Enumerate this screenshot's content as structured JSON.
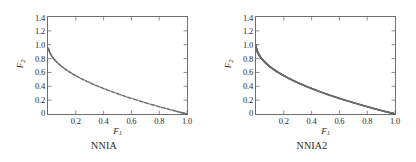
{
  "figure": {
    "background": "#ffffff",
    "curve_color": "#6b6b6b",
    "axis_color": "#6e6e6e"
  },
  "panels": [
    {
      "caption": "NNIA",
      "chart_data": {
        "type": "scatter",
        "title": "NNIA",
        "xlabel": "F1",
        "ylabel": "F2",
        "xlim": [
          0,
          1.0
        ],
        "ylim": [
          0,
          1.4
        ],
        "xticks": [
          "0.2",
          "0.4",
          "0.6",
          "0.8",
          "1.0"
        ],
        "xtick_values": [
          0.2,
          0.4,
          0.6,
          0.8,
          1.0
        ],
        "yticks": [
          "0",
          "0.2",
          "0.4",
          "0.6",
          "0.8",
          "1.0",
          "1.2",
          "1.4"
        ],
        "ytick_values": [
          0,
          0.2,
          0.4,
          0.6,
          0.8,
          1.0,
          1.2,
          1.4
        ],
        "grid": false,
        "legend": "none",
        "marker": "dot",
        "series": [
          {
            "name": "Pareto front (NNIA)",
            "relation": "F2 = 1 - sqrt(F1)",
            "x": [
              0.002,
              0.006,
              0.012,
              0.02,
              0.03,
              0.042,
              0.056,
              0.072,
              0.09,
              0.11,
              0.13,
              0.155,
              0.18,
              0.205,
              0.232,
              0.26,
              0.29,
              0.32,
              0.35,
              0.382,
              0.415,
              0.448,
              0.482,
              0.516,
              0.55,
              0.585,
              0.62,
              0.655,
              0.69,
              0.725,
              0.76,
              0.795,
              0.83,
              0.862,
              0.893,
              0.92,
              0.944,
              0.964,
              0.98,
              0.992,
              1.0
            ],
            "y": [
              0.955,
              0.923,
              0.89,
              0.859,
              0.827,
              0.795,
              0.763,
              0.732,
              0.7,
              0.668,
              0.639,
              0.606,
              0.576,
              0.547,
              0.518,
              0.49,
              0.461,
              0.434,
              0.408,
              0.382,
              0.356,
              0.331,
              0.306,
              0.282,
              0.258,
              0.235,
              0.213,
              0.191,
              0.169,
              0.149,
              0.128,
              0.108,
              0.089,
              0.072,
              0.055,
              0.041,
              0.028,
              0.018,
              0.01,
              0.004,
              0.0
            ]
          }
        ]
      }
    },
    {
      "caption": "NNIA2",
      "chart_data": {
        "type": "line",
        "title": "NNIA2",
        "xlabel": "F1",
        "ylabel": "F2",
        "xlim": [
          0,
          1.0
        ],
        "ylim": [
          0,
          1.4
        ],
        "xticks": [
          "0.2",
          "0.4",
          "0.6",
          "0.8",
          "1.0"
        ],
        "xtick_values": [
          0.2,
          0.4,
          0.6,
          0.8,
          1.0
        ],
        "yticks": [
          "0",
          "0.2",
          "0.4",
          "0.6",
          "0.8",
          "1.0",
          "1.2",
          "1.4"
        ],
        "ytick_values": [
          0,
          0.2,
          0.4,
          0.6,
          0.8,
          1.0,
          1.2,
          1.4
        ],
        "grid": false,
        "legend": "none",
        "marker": "dense-dot",
        "series": [
          {
            "name": "Pareto front (NNIA2)",
            "relation": "F2 = 1 - sqrt(F1)",
            "x": [
              0.0,
              0.002,
              0.005,
              0.01,
              0.016,
              0.024,
              0.034,
              0.046,
              0.06,
              0.075,
              0.092,
              0.11,
              0.13,
              0.152,
              0.175,
              0.2,
              0.226,
              0.253,
              0.281,
              0.31,
              0.34,
              0.371,
              0.403,
              0.436,
              0.47,
              0.505,
              0.54,
              0.576,
              0.612,
              0.649,
              0.686,
              0.723,
              0.76,
              0.797,
              0.833,
              0.868,
              0.901,
              0.932,
              0.959,
              0.981,
              0.995,
              1.0
            ],
            "y": [
              1.0,
              0.955,
              0.929,
              0.9,
              0.874,
              0.845,
              0.816,
              0.786,
              0.755,
              0.726,
              0.697,
              0.668,
              0.639,
              0.61,
              0.582,
              0.553,
              0.525,
              0.497,
              0.47,
              0.443,
              0.417,
              0.391,
              0.365,
              0.34,
              0.314,
              0.289,
              0.265,
              0.241,
              0.218,
              0.195,
              0.172,
              0.15,
              0.128,
              0.107,
              0.087,
              0.068,
              0.051,
              0.035,
              0.021,
              0.01,
              0.003,
              0.0
            ]
          }
        ]
      }
    }
  ]
}
